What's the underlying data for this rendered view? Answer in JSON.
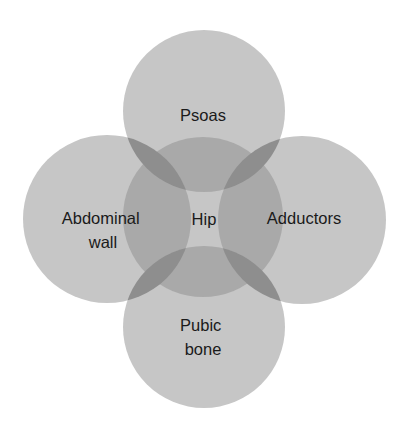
{
  "diagram": {
    "type": "venn-flower",
    "colors": {
      "background": "#ffffff",
      "single": "#c6c6c6",
      "double": "#a9a9a9",
      "lens": "#8e8e8e",
      "text": "#1a1a1a"
    },
    "center": {
      "id": "hip",
      "label": "Hip"
    },
    "petals": [
      {
        "id": "psoas",
        "position": "top",
        "lines": [
          "Psoas"
        ]
      },
      {
        "id": "abdominal-wall",
        "position": "left",
        "lines": [
          "Abdominal",
          "wall"
        ]
      },
      {
        "id": "adductors",
        "position": "right",
        "lines": [
          "Adductors"
        ]
      },
      {
        "id": "pubic-bone",
        "position": "bottom",
        "lines": [
          "Pubic",
          "bone"
        ]
      }
    ]
  }
}
